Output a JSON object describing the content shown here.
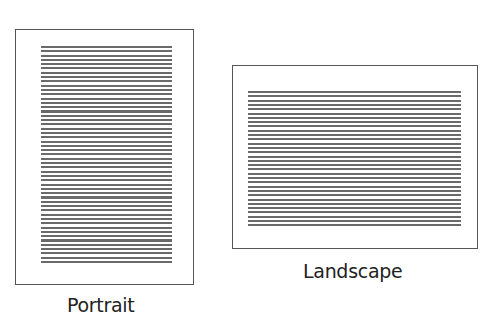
{
  "diagram": {
    "pages": [
      {
        "id": "portrait",
        "label": "Portrait",
        "orientation": "portrait",
        "line_count": 51
      },
      {
        "id": "landscape",
        "label": "Landscape",
        "orientation": "landscape",
        "line_count": 32
      }
    ]
  },
  "colors": {
    "border": "#555555",
    "lines": "#6a6a6a",
    "text": "#222222",
    "background": "#ffffff"
  }
}
